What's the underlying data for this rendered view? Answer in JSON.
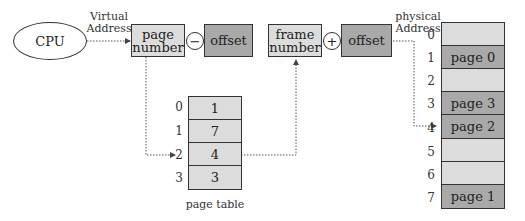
{
  "cpu": {
    "label": "CPU"
  },
  "virtual_address": {
    "label_line1": "Virtual",
    "label_line2": "Address"
  },
  "logical_address": {
    "page_number": {
      "line1": "page",
      "line2": "number"
    },
    "operator": "−",
    "offset": "offset"
  },
  "physical_address_parts": {
    "frame_number": {
      "line1": "frame",
      "line2": "number"
    },
    "operator": "+",
    "offset": "offset"
  },
  "physical_address": {
    "label_line1": "physical",
    "label_line2": "Address"
  },
  "page_table": {
    "caption": "page table",
    "rows": [
      {
        "index": "0",
        "value": "1"
      },
      {
        "index": "1",
        "value": "7"
      },
      {
        "index": "2",
        "value": "4"
      },
      {
        "index": "3",
        "value": "3"
      }
    ]
  },
  "physical_memory": {
    "frames": [
      {
        "index": "0",
        "label": ""
      },
      {
        "index": "1",
        "label": "page 0"
      },
      {
        "index": "2",
        "label": ""
      },
      {
        "index": "3",
        "label": "page 3"
      },
      {
        "index": "4",
        "label": "page 2"
      },
      {
        "index": "5",
        "label": ""
      },
      {
        "index": "6",
        "label": ""
      },
      {
        "index": "7",
        "label": "page 1"
      }
    ]
  },
  "colors": {
    "light_fill": "#dcdcdc",
    "dark_fill": "#a9a9a9",
    "border": "#333333"
  }
}
